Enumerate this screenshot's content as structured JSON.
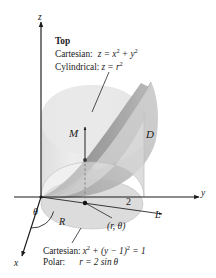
{
  "figure": {
    "title_top": "Top",
    "background_color": "#ffffff",
    "ink_color": "#1a1a1a",
    "surface_colors": {
      "cylinder_body": "#e6e6e6",
      "base_disk": "#d8d8d8",
      "paraboloid_upper": "#bdbdbd",
      "paraboloid_under": "#8f8f8f",
      "paraboloid_shadow": "#a6a6a6"
    }
  },
  "top_annotation": {
    "heading": "Top",
    "rows": [
      {
        "label": "Cartesian:",
        "equation_plain": "z = x^2 + y^2"
      },
      {
        "label": "Cylindrical:",
        "equation_plain": "z = r^2"
      }
    ]
  },
  "bottom_annotation": {
    "rows": [
      {
        "label": "Cartesian:",
        "equation_plain": "x^2 + (y - 1)^2 = 1"
      },
      {
        "label": "Polar:",
        "equation_plain": "r = 2 sin θ"
      }
    ]
  },
  "axes": [
    {
      "name": "z",
      "label": "z",
      "direction": "up"
    },
    {
      "name": "y",
      "label": "y",
      "direction": "right"
    },
    {
      "name": "x",
      "label": "x",
      "direction": "down-left"
    }
  ],
  "tick_marks": [
    {
      "axis": "y",
      "label": "2",
      "value": 2
    }
  ],
  "labels": [
    {
      "name": "M",
      "text": "M",
      "describes": "vertical line segment through solid"
    },
    {
      "name": "D",
      "text": "D",
      "describes": "solid region / cylinder wall"
    },
    {
      "name": "R",
      "text": "R",
      "describes": "base disk in xy-plane"
    },
    {
      "name": "L",
      "text": "L",
      "describes": "ray from origin at angle theta"
    },
    {
      "name": "theta",
      "text": "θ",
      "describes": "polar angle from x-axis"
    },
    {
      "name": "r-theta-point",
      "text": "(r, θ)",
      "describes": "point in base region"
    }
  ]
}
